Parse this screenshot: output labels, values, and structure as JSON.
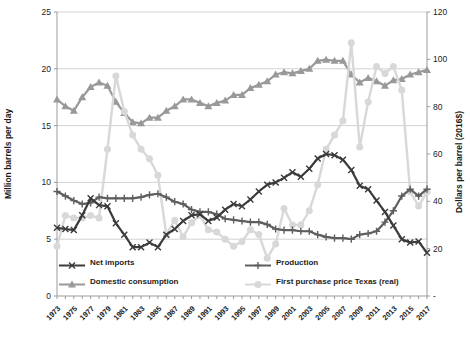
{
  "chart_data": {
    "type": "line",
    "title": "",
    "x": [
      1973,
      1974,
      1975,
      1976,
      1977,
      1978,
      1979,
      1980,
      1981,
      1982,
      1983,
      1984,
      1985,
      1986,
      1987,
      1988,
      1989,
      1990,
      1991,
      1992,
      1993,
      1994,
      1995,
      1996,
      1997,
      1998,
      1999,
      2000,
      2001,
      2002,
      2003,
      2004,
      2005,
      2006,
      2007,
      2008,
      2009,
      2010,
      2011,
      2012,
      2013,
      2014,
      2015,
      2016,
      2017
    ],
    "x_tick_labels": [
      "1973",
      "1975",
      "1977",
      "1979",
      "1981",
      "1983",
      "1985",
      "1987",
      "1989",
      "1991",
      "1993",
      "1995",
      "1997",
      "1999",
      "2001",
      "2003",
      "2005",
      "2007",
      "2009",
      "2011",
      "2013",
      "2015",
      "2017"
    ],
    "left_axis": {
      "label": "Million barrels per day",
      "min": 0,
      "max": 25,
      "step": 5,
      "tick_labels": [
        "0",
        "5",
        "10",
        "15",
        "20",
        "25"
      ]
    },
    "right_axis": {
      "label": "Dollars per barrel (2016$)",
      "min": 0,
      "max": 120,
      "step": 20,
      "tick_labels": [
        "-",
        "20",
        "40",
        "60",
        "80",
        "100",
        "120"
      ]
    },
    "grid": true,
    "legend_position": "bottom-inside",
    "series": [
      {
        "name": "Net imports",
        "axis": "left",
        "marker": "x",
        "color": "#3b3b3b",
        "line_width": 2.2,
        "values": [
          6.0,
          5.9,
          5.8,
          7.1,
          8.6,
          8.0,
          7.9,
          6.4,
          5.4,
          4.3,
          4.3,
          4.7,
          4.3,
          5.4,
          5.9,
          6.6,
          7.1,
          7.2,
          6.6,
          6.9,
          7.6,
          8.1,
          7.9,
          8.5,
          9.2,
          9.8,
          10.0,
          10.4,
          10.9,
          10.5,
          11.2,
          12.1,
          12.5,
          12.4,
          12.0,
          11.1,
          9.7,
          9.4,
          8.4,
          7.4,
          6.2,
          5.0,
          4.7,
          4.8,
          3.8
        ]
      },
      {
        "name": "Production",
        "axis": "left",
        "marker": "plus",
        "color": "#5e5e5e",
        "line_width": 2.2,
        "values": [
          9.2,
          8.8,
          8.4,
          8.1,
          8.2,
          8.7,
          8.6,
          8.6,
          8.6,
          8.6,
          8.7,
          8.9,
          9.0,
          8.7,
          8.3,
          8.1,
          7.6,
          7.4,
          7.4,
          7.2,
          6.8,
          6.7,
          6.6,
          6.5,
          6.5,
          6.3,
          5.9,
          5.8,
          5.8,
          5.7,
          5.7,
          5.4,
          5.2,
          5.1,
          5.1,
          5.0,
          5.4,
          5.5,
          5.7,
          6.5,
          7.5,
          8.8,
          9.4,
          8.8,
          9.4
        ]
      },
      {
        "name": "Domestic consumption",
        "axis": "left",
        "marker": "triangle",
        "color": "#999999",
        "line_width": 2.2,
        "values": [
          17.3,
          16.7,
          16.3,
          17.5,
          18.4,
          18.8,
          18.5,
          17.1,
          16.1,
          15.3,
          15.2,
          15.7,
          15.7,
          16.3,
          16.7,
          17.3,
          17.3,
          17.0,
          16.7,
          17.0,
          17.2,
          17.7,
          17.7,
          18.3,
          18.6,
          18.9,
          19.5,
          19.7,
          19.6,
          19.8,
          20.0,
          20.7,
          20.8,
          20.7,
          20.7,
          19.5,
          18.8,
          19.2,
          18.9,
          18.5,
          19.0,
          19.1,
          19.5,
          19.7,
          19.9
        ]
      },
      {
        "name": "First purchase price Texas (real)",
        "axis": "right",
        "marker": "circle",
        "color": "#d8d8d8",
        "line_width": 2.4,
        "values": [
          21,
          34,
          33,
          33,
          34,
          33,
          62,
          93,
          78,
          68,
          62,
          58,
          51,
          26,
          32,
          25,
          31,
          34,
          28,
          27,
          24,
          21,
          23,
          28,
          26,
          16,
          22,
          37,
          30,
          30,
          36,
          47,
          62,
          68,
          74,
          107,
          63,
          82,
          97,
          94,
          97,
          87,
          44,
          38,
          44
        ]
      }
    ],
    "colors": {
      "grid": "#d3d3d3",
      "axis": "#9b9b9b",
      "text": "#1c1c1c",
      "background": "#ffffff"
    }
  }
}
